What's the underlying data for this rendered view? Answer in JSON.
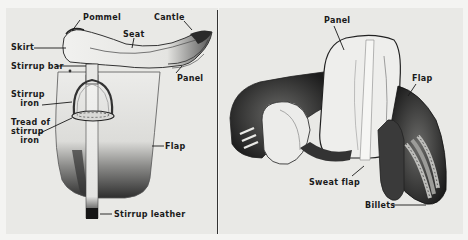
{
  "figure": {
    "type": "labeled-diagram",
    "background_color": "#e9e9e6",
    "line_color": "#1a1a1a"
  },
  "left_view": {
    "description": "Side view of saddle with stirrup",
    "labels": {
      "pommel": "Pommel",
      "cantle": "Cantle",
      "seat": "Seat",
      "skirt": "Skirt",
      "stirrup_bar": "Stirrup bar",
      "panel": "Panel",
      "stirrup_iron": "Stirrup\n   iron",
      "tread": "Tread of\nstirrup\n   iron",
      "flap": "Flap",
      "stirrup_leather": "Stirrup leather"
    }
  },
  "right_view": {
    "description": "Underside view of saddle",
    "labels": {
      "panel": "Panel",
      "flap": "Flap",
      "sweat_flap": "Sweat flap",
      "billets": "Billets"
    }
  }
}
